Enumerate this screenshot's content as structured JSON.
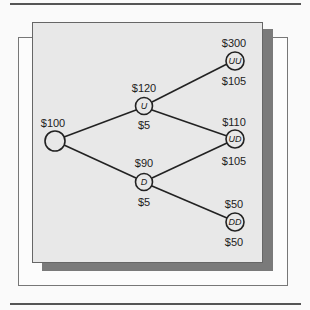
{
  "diagram": {
    "type": "binomial-tree",
    "nodes": [
      {
        "id": "root",
        "label": "",
        "top_value": "$100",
        "bottom_value": ""
      },
      {
        "id": "U",
        "label": "U",
        "top_value": "$120",
        "bottom_value": "$5"
      },
      {
        "id": "D",
        "label": "D",
        "top_value": "$90",
        "bottom_value": "$5"
      },
      {
        "id": "UU",
        "label": "UU",
        "top_value": "$300",
        "bottom_value": "$105"
      },
      {
        "id": "UD",
        "label": "UD",
        "top_value": "$110",
        "bottom_value": "$105"
      },
      {
        "id": "DD",
        "label": "DD",
        "top_value": "$50",
        "bottom_value": "$50"
      }
    ],
    "edges": [
      [
        "root",
        "U"
      ],
      [
        "root",
        "D"
      ],
      [
        "U",
        "UU"
      ],
      [
        "U",
        "UD"
      ],
      [
        "D",
        "UD"
      ],
      [
        "D",
        "DD"
      ]
    ],
    "colors": {
      "panel": "#e8e8e8",
      "shadow": "#7a7a7a",
      "line": "#222222"
    }
  }
}
